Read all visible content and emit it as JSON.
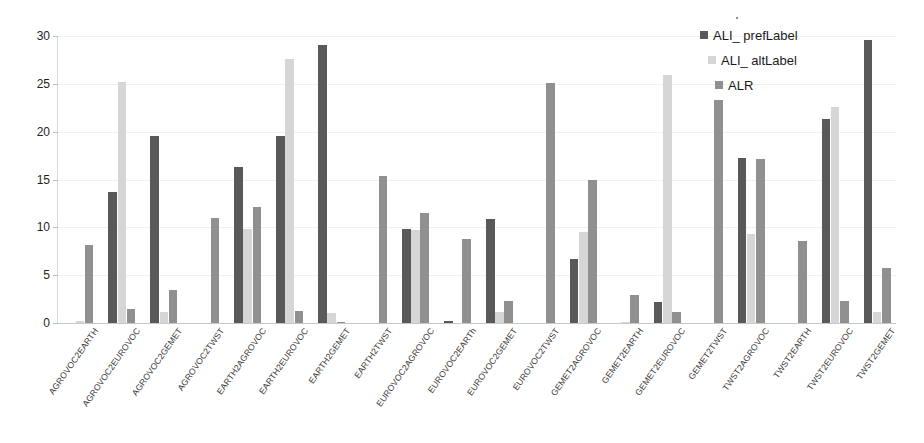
{
  "chart_data": {
    "type": "bar",
    "title": "",
    "xlabel": "",
    "ylabel": "",
    "ylim": [
      0,
      30
    ],
    "yticks": [
      0,
      5,
      10,
      15,
      20,
      25,
      30
    ],
    "grid": true,
    "legend_position": "top-right",
    "categories": [
      "AGROVOC2EARTH",
      "AGROVOC2EUROVOC",
      "AGROVOC2GEMET",
      "AGROVOC2TWST",
      "EARTH2AGROVOC",
      "EARTH2EUROVOC",
      "EARTH2GEMET",
      "EARTH2TWST",
      "EUROVOC2AGROVOC",
      "EUROVOC2EARTh",
      "EUROVOC2GEMET",
      "EUROVOC2TWST",
      "GEMET2AGROVOC",
      "GEMET2EARTH",
      "GEMET2EUROVOC",
      "GEMET2TWST",
      "TWST2AGROVOC",
      "TWST2EARTH",
      "TWST2EUROVOC",
      "TWST2GEMET"
    ],
    "series": [
      {
        "name": "ALI_ prefLabel",
        "color": "#595959",
        "values": [
          0,
          13.7,
          19.5,
          0,
          16.3,
          19.5,
          29.1,
          0,
          9.8,
          0.2,
          10.9,
          0,
          6.7,
          0,
          2.2,
          0,
          17.2,
          0,
          21.3,
          29.6
        ]
      },
      {
        "name": "ALI_ altLabel",
        "color": "#d6d6d6",
        "values": [
          0.2,
          25.2,
          1.1,
          0,
          9.8,
          27.6,
          1.0,
          0,
          9.7,
          0,
          1.1,
          0,
          9.5,
          0.15,
          25.9,
          0,
          9.3,
          0,
          22.6,
          1.2
        ]
      },
      {
        "name": "ALR",
        "color": "#909090",
        "values": [
          8.2,
          1.5,
          3.4,
          11.0,
          12.1,
          1.3,
          0.15,
          15.4,
          11.5,
          8.8,
          2.3,
          25.1,
          15.0,
          2.9,
          1.2,
          23.3,
          17.1,
          8.6,
          2.3,
          5.7
        ]
      }
    ]
  },
  "legend": {
    "items": [
      {
        "label": "ALI_ prefLabel"
      },
      {
        "label": "ALI_ altLabel"
      },
      {
        "label": "ALR"
      }
    ]
  }
}
